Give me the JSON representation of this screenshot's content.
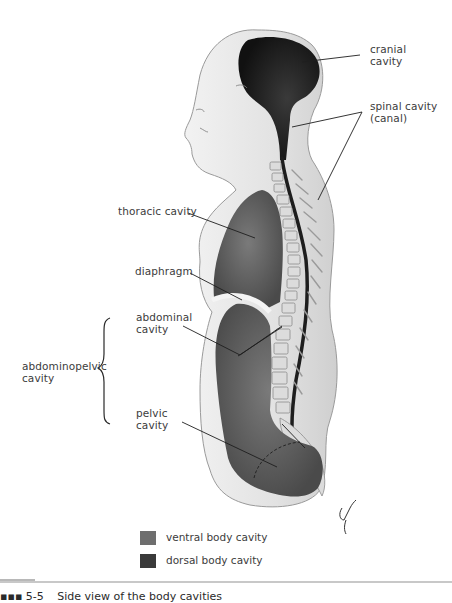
{
  "figure": {
    "title": "Side view of the body cavities",
    "caption_prefix": "▪▪▪ 5-5",
    "labels": {
      "cranial_cavity": "cranial\ncavity",
      "spinal_cavity": "spinal cavity\n(canal)",
      "thoracic_cavity": "thoracic cavity",
      "diaphragm": "diaphragm",
      "abdominal_cavity": "abdominal\ncavity",
      "abdominopelvic_cavity": "abdominopelvic\ncavity",
      "pelvic_cavity": "pelvic\ncavity"
    },
    "legend": [
      {
        "label": "ventral body cavity",
        "color": "#6e6e6e"
      },
      {
        "label": "dorsal body cavity",
        "color": "#3a3a3a"
      }
    ],
    "colors": {
      "skin": "#e4e4e4",
      "skin_edge": "#9a9a9a",
      "ventral": "#5f5f5f",
      "dorsal": "#262626",
      "vertebra": "#d8d8d8",
      "leader": "#1e1e1e"
    }
  }
}
